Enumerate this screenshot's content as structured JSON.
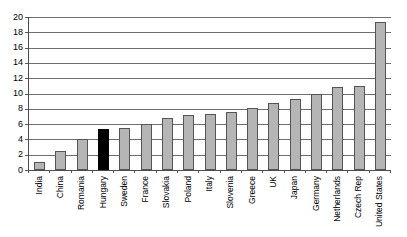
{
  "chart_data": {
    "type": "bar",
    "title": "",
    "subtitle": "",
    "xlabel": "",
    "ylabel": "",
    "ylim": [
      0,
      20
    ],
    "yticks": [
      0,
      2,
      4,
      6,
      8,
      10,
      12,
      14,
      16,
      18,
      20
    ],
    "grid": true,
    "legend": null,
    "categories": [
      "India",
      "China",
      "Romania",
      "Hungary",
      "Sweden",
      "France",
      "Slovakia",
      "Poland",
      "Italy",
      "Slovenia",
      "Greece",
      "UK",
      "Japan",
      "Germany",
      "Netherlands",
      "Czech Rep",
      "United States"
    ],
    "values": [
      1.0,
      2.5,
      4.0,
      5.3,
      5.5,
      6.0,
      6.8,
      7.2,
      7.3,
      7.6,
      8.1,
      8.8,
      9.3,
      10.0,
      10.8,
      11.0,
      19.4
    ],
    "highlight_index": 3,
    "colors": {
      "bar_fill": "#b5b5b5",
      "bar_border": "#555555",
      "highlight_fill": "#000000",
      "gridline": "#6e6e6e",
      "axis": "#4d4d4d",
      "text": "#000000",
      "background": "#ffffff"
    }
  }
}
